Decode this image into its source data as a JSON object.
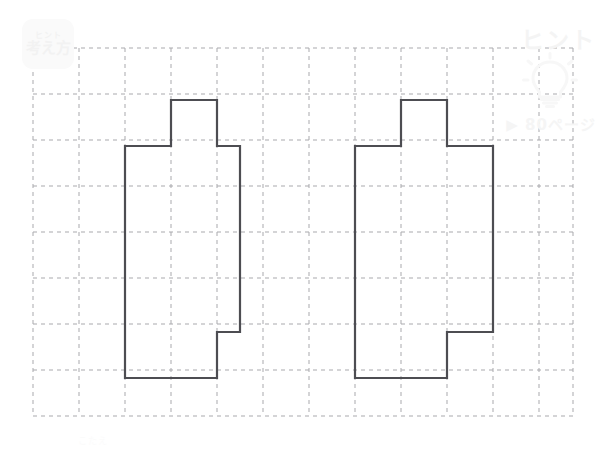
{
  "page": {
    "background_color": "#ffffff",
    "width": 610,
    "height": 451
  },
  "watermarks": {
    "hint_badge": {
      "label_small": "ヒント",
      "label": "考え方",
      "color": "#fafafa"
    },
    "hint_word": {
      "text": "ヒント",
      "color": "#f4f4f4"
    },
    "bulb": {
      "icon": "lightbulb-icon",
      "color": "#fafafa"
    },
    "page_reference": {
      "text": "▶ 80ページ",
      "color": "#f5f5f5"
    },
    "footer_note": {
      "text": "こたえ",
      "color": "#fbfbfb"
    }
  },
  "grid": {
    "line_color": "#a9a9ad",
    "line_style": "dashed",
    "line_width": 1,
    "cell_size": 46,
    "origin_x": 33,
    "origin_y": 48,
    "columns": 12,
    "rows": 8,
    "x_lines": [
      33,
      79,
      125,
      171,
      217,
      263,
      309,
      355,
      401,
      447,
      493,
      539,
      573
    ],
    "y_lines": [
      48,
      94,
      140,
      186,
      232,
      278,
      324,
      370,
      416
    ]
  },
  "figures": {
    "stroke_color": "#4d4d52",
    "stroke_width": 2.2,
    "fill": "none",
    "count": 2,
    "items": [
      {
        "name": "figure-left",
        "label": "left-polygon",
        "vertices": [
          [
            171,
            100
          ],
          [
            217,
            100
          ],
          [
            217,
            146
          ],
          [
            240,
            146
          ],
          [
            240,
            332
          ],
          [
            217,
            332
          ],
          [
            217,
            378
          ],
          [
            125,
            378
          ],
          [
            125,
            146
          ],
          [
            171,
            146
          ]
        ]
      },
      {
        "name": "figure-right",
        "label": "right-polygon",
        "vertices": [
          [
            401,
            100
          ],
          [
            447,
            100
          ],
          [
            447,
            146
          ],
          [
            493,
            146
          ],
          [
            493,
            332
          ],
          [
            447,
            332
          ],
          [
            447,
            378
          ],
          [
            355,
            378
          ],
          [
            355,
            146
          ],
          [
            401,
            146
          ]
        ]
      }
    ]
  }
}
